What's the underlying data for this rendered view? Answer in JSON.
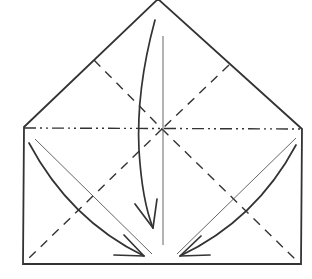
{
  "diagram": {
    "type": "origami-fold-diagram",
    "colors": {
      "line": "#333333",
      "background": "#ffffff"
    },
    "outline": {
      "label": "paper-outline"
    },
    "folds": [
      {
        "kind": "mountain-fold",
        "label": "horizontal-mountain-fold"
      },
      {
        "kind": "valley-fold",
        "label": "valley-fold-upper-left"
      },
      {
        "kind": "valley-fold",
        "label": "valley-fold-upper-right"
      },
      {
        "kind": "valley-fold",
        "label": "valley-fold-lower-left"
      },
      {
        "kind": "valley-fold",
        "label": "valley-fold-lower-right"
      }
    ],
    "arrows": [
      {
        "direction": "down",
        "label": "fold-top-down"
      },
      {
        "direction": "down-right",
        "label": "fold-left-corner-in"
      },
      {
        "direction": "down-left",
        "label": "fold-right-corner-in"
      }
    ]
  }
}
